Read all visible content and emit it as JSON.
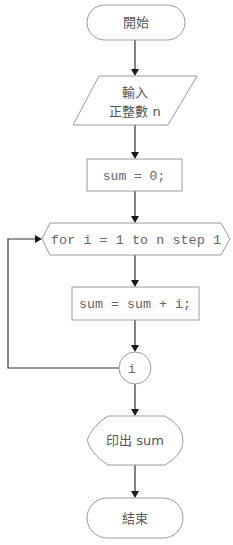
{
  "flowchart": {
    "start": {
      "label": "開始",
      "shape": "terminator"
    },
    "input": {
      "line1": "輸入",
      "line2": "正整數 n",
      "shape": "parallelogram"
    },
    "init": {
      "label": "sum = 0;",
      "shape": "process"
    },
    "loop": {
      "label": "for i = 1 to n step 1",
      "shape": "hexagon"
    },
    "body": {
      "label": "sum = sum + i;",
      "shape": "process"
    },
    "connector": {
      "label": "i",
      "shape": "circle"
    },
    "output": {
      "label": "印出 sum",
      "shape": "display"
    },
    "end": {
      "label": "結束",
      "shape": "terminator"
    }
  },
  "colors": {
    "shape_stroke": "#9a9a9a",
    "line": "#333333",
    "text": "#555555"
  }
}
